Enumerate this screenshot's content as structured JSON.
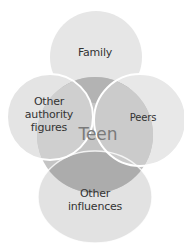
{
  "diagram": {
    "type": "venn-influence-diagram",
    "center": {
      "label": "Teen"
    },
    "nodes": [
      {
        "id": "family",
        "label": "Family"
      },
      {
        "id": "authority",
        "label": "Other authority figures",
        "lines": [
          "Other",
          "authority",
          "figures"
        ]
      },
      {
        "id": "peers",
        "label": "Peers"
      },
      {
        "id": "influences",
        "label": "Other influences",
        "lines": [
          "Other",
          "influences"
        ]
      }
    ],
    "colors": {
      "background": "#ffffff",
      "outer_fill": "#e6e6e6",
      "center_fill": "#bdbdbd",
      "overlap_fill": "#a9a9a9",
      "outline": "#ffffff",
      "label_text": "#333333",
      "center_text": "#7a7a7a"
    }
  }
}
